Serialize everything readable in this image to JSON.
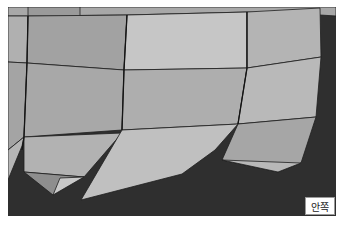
{
  "figure": {
    "label": "안쪽",
    "colors": {
      "background": "#2f2f2f",
      "face_light": "#c4c4c4",
      "face_mid": "#a9a9a9",
      "face_dark": "#969696",
      "edge": "#1e1e1e"
    }
  }
}
